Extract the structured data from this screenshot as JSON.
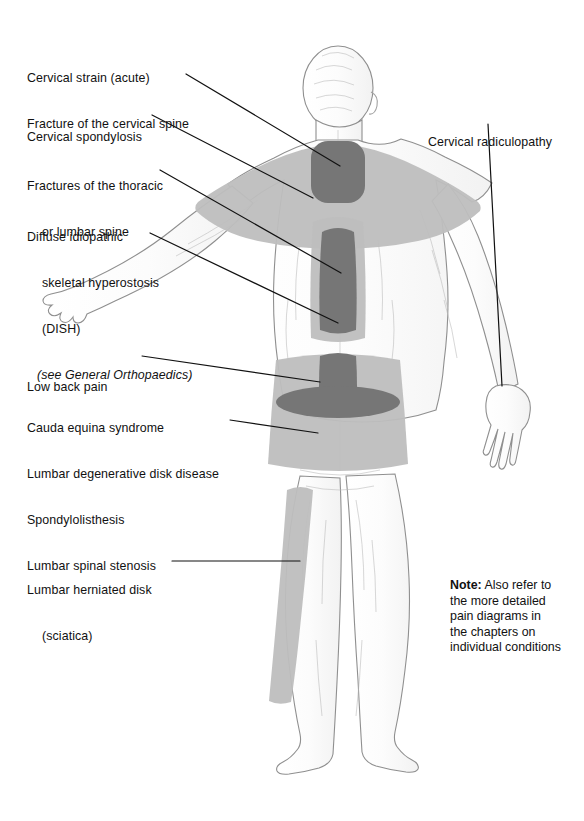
{
  "figure": {
    "view": "posterior (back) view of standing human male figure",
    "colors": {
      "pain_light": "#bebebe",
      "pain_dark": "#767676",
      "body_outline": "#9a9a9a",
      "body_fill": "#ffffff",
      "leader_line": "#111111",
      "text": "#111111",
      "background": "#ffffff"
    },
    "pain_regions": [
      {
        "name": "cervical-neck-zone",
        "shade": "dark"
      },
      {
        "name": "shoulder-upper-back-zone",
        "shade": "light"
      },
      {
        "name": "thoracic-mid-spine-zone",
        "shade": "dark"
      },
      {
        "name": "mid-lower-back-band",
        "shade": "light"
      },
      {
        "name": "lumbosacral-zone",
        "shade": "dark"
      },
      {
        "name": "lumbar-belt-zone",
        "shade": "light"
      },
      {
        "name": "posterior-thigh-sciatica-stripe",
        "shade": "light"
      }
    ]
  },
  "labels": {
    "cervical_strain": {
      "lines": [
        "Cervical strain (acute)",
        "Fracture of the cervical spine"
      ]
    },
    "cervical_spondylosis": {
      "lines": [
        "Cervical spondylosis"
      ]
    },
    "fractures_thoracic": {
      "lines": [
        "Fractures of the thoracic",
        "or lumbar spine"
      ]
    },
    "dish": {
      "lines": [
        "Diffuse idiopathic",
        "skeletal hyperostosis",
        "(DISH)"
      ],
      "italic": "(see General Orthopaedics)"
    },
    "low_back_pain": {
      "lines": [
        "Low back pain"
      ]
    },
    "cauda_equina": {
      "lines": [
        "Cauda equina syndrome",
        "Lumbar degenerative disk disease",
        "Spondylolisthesis",
        "Lumbar spinal stenosis"
      ]
    },
    "herniated_disk": {
      "lines": [
        "Lumbar herniated disk",
        "(sciatica)"
      ]
    },
    "cervical_radiculopathy": {
      "lines": [
        "Cervical radiculopathy"
      ]
    }
  },
  "note": {
    "label": "Note:",
    "lines": [
      " Also refer to",
      "the more detailed",
      "pain diagrams in",
      "the chapters on",
      "individual conditions"
    ]
  }
}
